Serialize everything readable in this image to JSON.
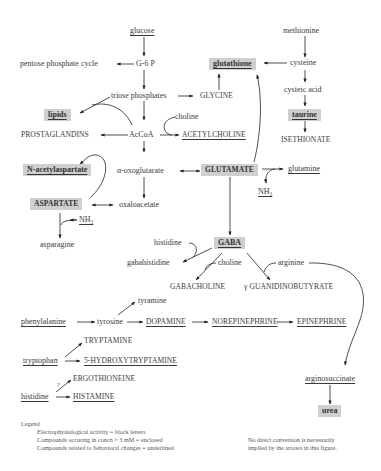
{
  "diagram": {
    "nodes": {
      "glucose": "glucose",
      "pentose": "pentose phosphate cycle",
      "g6p": "G-6 P",
      "triose": "triose phosphates",
      "glycine": "GLYCINE",
      "lipids": "lipids",
      "prostaglandins": "PROSTAGLANDINS",
      "accoa": "AcCoA",
      "choline1": "choline",
      "acetylcholine": "ACETYLCHOLINE",
      "nacetylaspartate": "N-acetylaspartate",
      "oxoglutarate": "α-oxoglutarate",
      "glutamate": "GLUTAMATE",
      "glutamine": "glutamine",
      "nh3_glu": "NH₃",
      "aspartate": "ASPARTATE",
      "nh3_asp": "NH₃",
      "oxaloacetate": "oxaloacetate",
      "asparagine": "asparagine",
      "methionine": "methionine",
      "glutathione": "glutathione",
      "cysteine": "cysteine",
      "cysteic": "cysteic acid",
      "taurine": "taurine",
      "isethionate": "ISETHIONATE",
      "histidine1": "histidine",
      "gaba": "GABA",
      "gabahistidine": "gabahistidine",
      "choline2": "choline",
      "arginine": "arginine",
      "gabacholine": "GABACHOLINE",
      "guanidinobutyrate": "γ GUANIDINOBUTYRATE",
      "tyramine": "tyramine",
      "phenylalanine": "phenylalanine",
      "tyrosine": "tyrosine",
      "dopamine": "DOPAMINE",
      "norepinephrine": "NOREPINEPHRINE",
      "epinephrine": "EPINEPHRINE",
      "tryptamine": "TRYPTAMINE",
      "tryptophan": "tryptophan",
      "hydroxytryptamine": "5-HYDROXYTRYPTAMINE",
      "ergothioneine": "ERGOTHIONEINE",
      "question": "?",
      "histidine2": "histidine",
      "histamine": "HISTAMINE",
      "arginosuccinate": "arginosuccinate",
      "urea": "urea"
    },
    "legend": {
      "title": "Legend",
      "lines": [
        "Electrophysiological activity = block letters",
        "Compounds occuring in concn > 3 mM = enclosed",
        "Compounds related to behavioral changes = underlined"
      ],
      "note": [
        "No direct conversion is necessarily",
        "implied by the arrows in this figure."
      ]
    },
    "colors": {
      "box_fill": "#cfcfcf",
      "line": "#222222",
      "text": "#3a3a3a"
    }
  }
}
